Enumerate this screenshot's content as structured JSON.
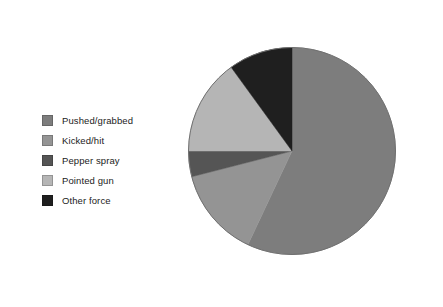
{
  "chart_data": {
    "type": "pie",
    "title": "",
    "subtitle": "",
    "xlabel": "",
    "ylabel": "",
    "legend_position": "left",
    "grid": false,
    "start_angle_deg": 0,
    "direction": "clockwise",
    "categories": [
      "Pushed/grabbed",
      "Kicked/hit",
      "Pepper spray",
      "Pointed gun",
      "Other force"
    ],
    "values": [
      57,
      14,
      4,
      15,
      10
    ],
    "colors": [
      "#7d7d7d",
      "#949494",
      "#555555",
      "#b5b5b5",
      "#1f1f1f"
    ],
    "slices": [
      {
        "label": "Pushed/grabbed",
        "value": 57,
        "color": "#7d7d7d"
      },
      {
        "label": "Kicked/hit",
        "value": 14,
        "color": "#949494"
      },
      {
        "label": "Pepper spray",
        "value": 4,
        "color": "#555555"
      },
      {
        "label": "Pointed gun",
        "value": 15,
        "color": "#b5b5b5"
      },
      {
        "label": "Other force",
        "value": 10,
        "color": "#1f1f1f"
      }
    ]
  },
  "legend": {
    "items": [
      {
        "label": "Pushed/grabbed",
        "color": "#7d7d7d"
      },
      {
        "label": "Kicked/hit",
        "color": "#949494"
      },
      {
        "label": "Pepper spray",
        "color": "#555555"
      },
      {
        "label": "Pointed gun",
        "color": "#b5b5b5"
      },
      {
        "label": "Other force",
        "color": "#1f1f1f"
      }
    ]
  },
  "figure": {
    "background": "#ffffff",
    "pie_outline": "#6f6f6f"
  }
}
